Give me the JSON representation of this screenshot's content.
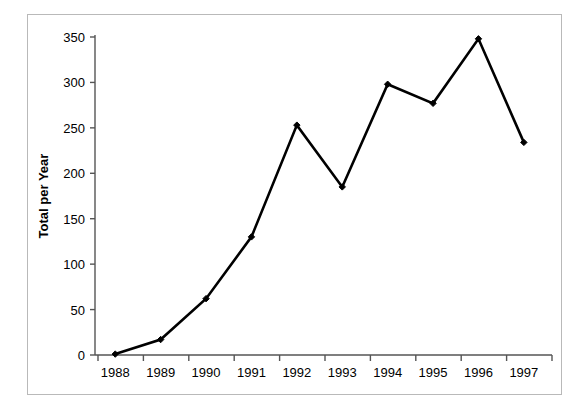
{
  "figure": {
    "background_color": "#ffffff",
    "frame_border_color": "#b9b9b9",
    "axis_color": "#555555",
    "series_color": "#000000"
  },
  "chart_data": {
    "type": "line",
    "title": "",
    "subtitle": "",
    "xlabel": "",
    "ylabel": "Total per Year",
    "categories": [
      "1988",
      "1989",
      "1990",
      "1991",
      "1992",
      "1993",
      "1994",
      "1995",
      "1996",
      "1997"
    ],
    "values": [
      1,
      17,
      62,
      130,
      253,
      185,
      298,
      277,
      348,
      234
    ],
    "series": [
      {
        "name": "Total per Year",
        "values": [
          1,
          17,
          62,
          130,
          253,
          185,
          298,
          277,
          348,
          234
        ]
      }
    ],
    "ylim": [
      0,
      350
    ],
    "yticks": [
      0,
      50,
      100,
      150,
      200,
      250,
      300,
      350
    ],
    "ytick_labels": [
      "0",
      "50",
      "100",
      "150",
      "200",
      "250",
      "300",
      "350"
    ],
    "xtick_labels": [
      "1988",
      "1989",
      "1990",
      "1991",
      "1992",
      "1993",
      "1994",
      "1995",
      "1996",
      "1997"
    ],
    "grid": false,
    "legend": false,
    "legend_position": "none",
    "marker": "diamond",
    "annotations": []
  }
}
